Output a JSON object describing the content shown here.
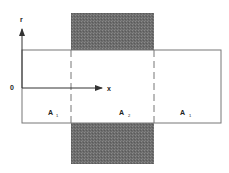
{
  "diagram": {
    "axes": {
      "origin_label": "0",
      "vertical_label": "r",
      "horizontal_label": "x"
    },
    "regions": [
      {
        "label": "A",
        "subscript": "1"
      },
      {
        "label": "A",
        "subscript": "2"
      },
      {
        "label": "A",
        "subscript": "1"
      }
    ],
    "colors": {
      "shaded": "#6e6e6e",
      "lines": "#555555",
      "background": "#ffffff"
    }
  }
}
